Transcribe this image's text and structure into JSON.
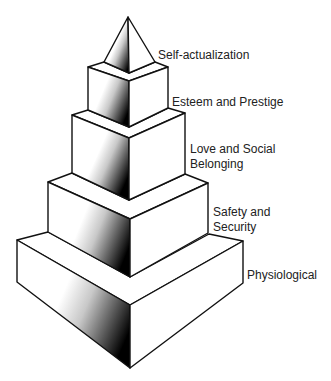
{
  "diagram": {
    "levels": [
      {
        "name": "self-actualization",
        "line1": "Self-actualization",
        "line2": ""
      },
      {
        "name": "esteem",
        "line1": "Esteem and Prestige",
        "line2": ""
      },
      {
        "name": "love",
        "line1": "Love and Social",
        "line2": "Belonging"
      },
      {
        "name": "safety",
        "line1": "Safety and",
        "line2": "Security"
      },
      {
        "name": "physiological",
        "line1": "Physiological",
        "line2": ""
      }
    ],
    "colors": {
      "stroke": "#111111",
      "face": "#ffffff",
      "shadow": "#000000"
    }
  }
}
